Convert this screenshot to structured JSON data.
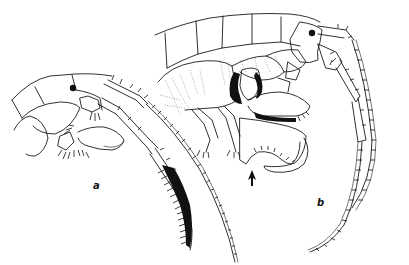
{
  "figure": {
    "panels": [
      {
        "id": "a",
        "label": "a"
      },
      {
        "id": "b",
        "label": "b"
      }
    ],
    "annotations": [
      {
        "type": "arrow",
        "panel": "b",
        "points_to": "gnathopod palm notch"
      }
    ],
    "colors": {
      "ink": "#1a1a1a",
      "background": "#ffffff"
    }
  }
}
